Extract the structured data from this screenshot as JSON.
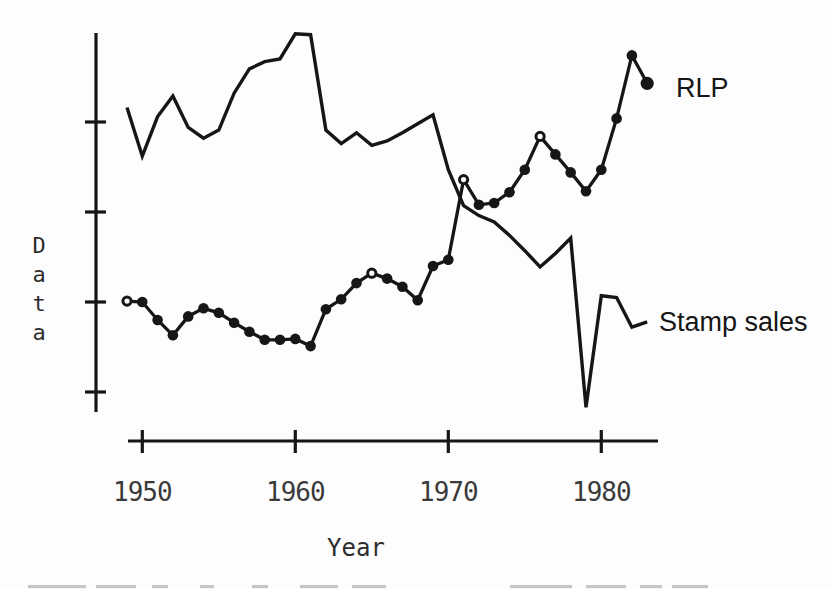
{
  "window": {
    "background": "#fdfdfd",
    "ink": "#161616",
    "tick_text_color": "#3a3a3a",
    "artifact_gray": "#c6c6c6"
  },
  "chart_data": {
    "type": "line",
    "title": "",
    "xlabel": "Year",
    "ylabel": "Data",
    "grid": "off",
    "legend": "inline-annotations",
    "x_axis": {
      "tick_years": [
        1950,
        1960,
        1970,
        1980
      ],
      "tick_labels": [
        "1950",
        "1960",
        "1970",
        "1980"
      ],
      "range_years": [
        1949,
        1983
      ]
    },
    "y_axis": {
      "tick_values": [
        1,
        2,
        3,
        4
      ],
      "tick_labels": [
        "",
        "",
        "",
        ""
      ],
      "labeled": false,
      "ylim": [
        0.7,
        5.0
      ]
    },
    "x": [
      1949,
      1950,
      1951,
      1952,
      1953,
      1954,
      1955,
      1956,
      1957,
      1958,
      1959,
      1960,
      1961,
      1962,
      1963,
      1964,
      1965,
      1966,
      1967,
      1968,
      1969,
      1970,
      1971,
      1972,
      1973,
      1974,
      1975,
      1976,
      1977,
      1978,
      1979,
      1980,
      1981,
      1982,
      1983
    ],
    "series": [
      {
        "name": "Stamp sales",
        "marker": "none",
        "label_position": "mid-right",
        "values": [
          4.16,
          3.62,
          4.06,
          4.29,
          3.94,
          3.82,
          3.91,
          4.32,
          4.59,
          4.67,
          4.7,
          4.98,
          4.97,
          3.91,
          3.76,
          3.88,
          3.74,
          3.79,
          3.88,
          3.98,
          4.08,
          3.47,
          3.07,
          2.96,
          2.89,
          2.74,
          2.57,
          2.39,
          2.54,
          2.71,
          0.83,
          2.07,
          2.05,
          1.72,
          1.78
        ]
      },
      {
        "name": "RLP",
        "marker": "circle",
        "label_position": "top-right",
        "open_marker_years": [
          1949,
          1965,
          1971,
          1976
        ],
        "values": [
          2.01,
          2.0,
          1.8,
          1.63,
          1.84,
          1.93,
          1.88,
          1.77,
          1.67,
          1.58,
          1.58,
          1.59,
          1.51,
          1.92,
          2.03,
          2.21,
          2.32,
          2.26,
          2.17,
          2.02,
          2.4,
          2.47,
          3.36,
          3.08,
          3.1,
          3.22,
          3.47,
          3.84,
          3.64,
          3.44,
          3.23,
          3.47,
          4.04,
          4.74,
          4.43
        ]
      }
    ]
  },
  "artifacts": {
    "bottom_edge_cropped_text": true
  }
}
